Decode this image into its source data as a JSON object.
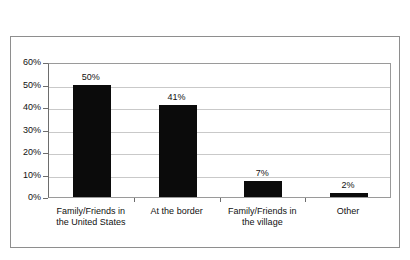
{
  "caption_remnant": "",
  "chart_data": {
    "type": "bar",
    "title": "",
    "xlabel": "",
    "ylabel": "",
    "ylim": [
      0,
      60
    ],
    "ytick_labels": [
      "60%",
      "50%",
      "40%",
      "30%",
      "20%",
      "10%",
      "0%"
    ],
    "ytick_values": [
      60,
      50,
      40,
      30,
      20,
      10,
      0
    ],
    "grid": true,
    "legend": false,
    "bar_color": "#0b0b0b",
    "categories": [
      "Family/Friends in the United States",
      "At the border",
      "Family/Friends in the village",
      "Other"
    ],
    "category_lines": [
      [
        "Family/Friends in",
        "the United States"
      ],
      [
        "At the border"
      ],
      [
        "Family/Friends in",
        "the village"
      ],
      [
        "Other"
      ]
    ],
    "values": [
      50,
      41,
      7,
      2
    ],
    "data_labels": [
      "50%",
      "41%",
      "7%",
      "2%"
    ]
  }
}
